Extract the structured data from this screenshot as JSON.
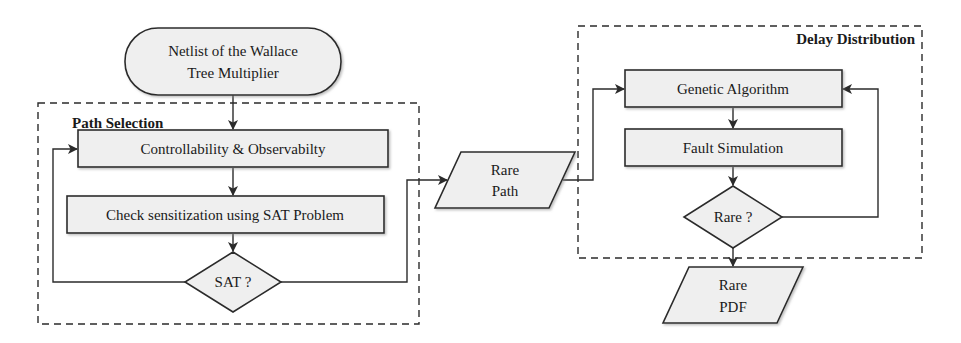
{
  "diagram": {
    "type": "flowchart",
    "colors": {
      "stroke": "#2b2b2b",
      "node_fill": "#efefef",
      "background": "#ffffff",
      "text": "#1a1a1a"
    },
    "groups": {
      "path_selection": {
        "title": "Path Selection"
      },
      "delay_distribution": {
        "title": "Delay Distribution"
      }
    },
    "nodes": {
      "netlist": {
        "shape": "terminal",
        "line1": "Netlist of the Wallace",
        "line2": "Tree Multiplier"
      },
      "controllability": {
        "shape": "process",
        "label": "Controllability & Observabilty"
      },
      "check_sat": {
        "shape": "process",
        "label": "Check sensitization using SAT Problem"
      },
      "sat_decision": {
        "shape": "decision",
        "label": "SAT ?"
      },
      "rare_path": {
        "shape": "data",
        "line1": "Rare",
        "line2": "Path"
      },
      "genetic_algorithm": {
        "shape": "process",
        "label": "Genetic Algorithm"
      },
      "fault_simulation": {
        "shape": "process",
        "label": "Fault Simulation"
      },
      "rare_decision": {
        "shape": "decision",
        "label": "Rare ?"
      },
      "rare_pdf": {
        "shape": "data",
        "line1": "Rare",
        "line2": "PDF"
      }
    },
    "edges": [
      {
        "from": "netlist",
        "to": "controllability"
      },
      {
        "from": "controllability",
        "to": "check_sat"
      },
      {
        "from": "check_sat",
        "to": "sat_decision"
      },
      {
        "from": "sat_decision",
        "to": "controllability",
        "route": "left loop"
      },
      {
        "from": "sat_decision",
        "to": "rare_path",
        "route": "right"
      },
      {
        "from": "rare_path",
        "to": "genetic_algorithm"
      },
      {
        "from": "genetic_algorithm",
        "to": "fault_simulation"
      },
      {
        "from": "fault_simulation",
        "to": "rare_decision"
      },
      {
        "from": "rare_decision",
        "to": "genetic_algorithm",
        "route": "right loop"
      },
      {
        "from": "rare_decision",
        "to": "rare_pdf"
      }
    ]
  }
}
